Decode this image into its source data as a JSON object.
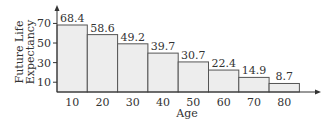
{
  "chart_data": {
    "type": "bar",
    "title": "",
    "xlabel": "Age",
    "ylabel": "Future Life Expectancy",
    "ylabel_lines": [
      "Future Life",
      "Expectancy"
    ],
    "categories": [
      "10",
      "20",
      "30",
      "40",
      "50",
      "60",
      "70",
      "80"
    ],
    "values": [
      68.4,
      58.6,
      49.2,
      39.7,
      30.7,
      22.4,
      14.9,
      8.7
    ],
    "value_labels": [
      "68.4",
      "58.6",
      "49.2",
      "39.7",
      "30.7",
      "22.4",
      "14.9",
      "8.7"
    ],
    "y_ticks": [
      "10",
      "30",
      "50",
      "70"
    ],
    "y_tick_values": [
      10,
      30,
      50,
      70
    ],
    "ylim": [
      0,
      80
    ],
    "grid": false,
    "legend": null,
    "bar_fill": "#ededed",
    "bar_stroke": "#555555"
  }
}
